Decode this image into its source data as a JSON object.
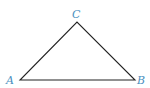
{
  "diagram": {
    "type": "triangle",
    "stroke_color": "#222222",
    "label_color": "#4a8fc0",
    "vertices": [
      {
        "label": "A",
        "x": 20,
        "y": 80
      },
      {
        "label": "B",
        "x": 135,
        "y": 80
      },
      {
        "label": "C",
        "x": 77,
        "y": 22
      }
    ]
  }
}
